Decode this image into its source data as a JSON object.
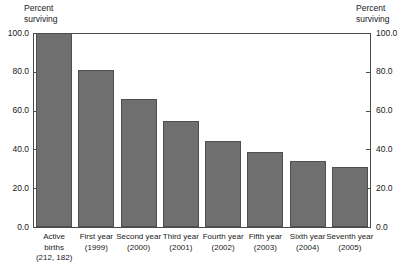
{
  "chart_data": {
    "type": "bar",
    "title": "",
    "ylabel": "Percent surviving",
    "ylabel_right": "Percent surviving",
    "xlabel": "",
    "ylim": [
      0,
      100
    ],
    "grid": false,
    "legend": "none",
    "bar_color": "#6f6f6f",
    "bar_border_color": "#4f4f4f",
    "axis_color": "#4a4a4a",
    "categories": [
      "Active births (212, 182)",
      "First year (1999)",
      "Second year (2000)",
      "Third year (2001)",
      "Fourth year (2002)",
      "Fifth year (2003)",
      "Sixth year (2004)",
      "Seventh year (2005)"
    ],
    "values": [
      100.0,
      81.0,
      66.0,
      54.5,
      44.5,
      38.5,
      34.0,
      31.0
    ],
    "ytick_values": [
      0,
      20,
      40,
      60,
      80,
      100
    ],
    "ytick_labels": [
      "0.0",
      "20.0",
      "40.0",
      "60.0",
      "80.0",
      "100.0"
    ]
  },
  "axis": {
    "left_caption": "Percent\nsurviving",
    "right_caption": "Percent\nsurviving"
  },
  "categories_multiline": [
    "Active\nbirths\n(212, 182)",
    "First year\n(1999)",
    "Second year\n(2000)",
    "Third year\n(2001)",
    "Fourth year\n(2002)",
    "Fifth year\n(2003)",
    "Sixth year\n(2004)",
    "Seventh year\n(2005)"
  ]
}
